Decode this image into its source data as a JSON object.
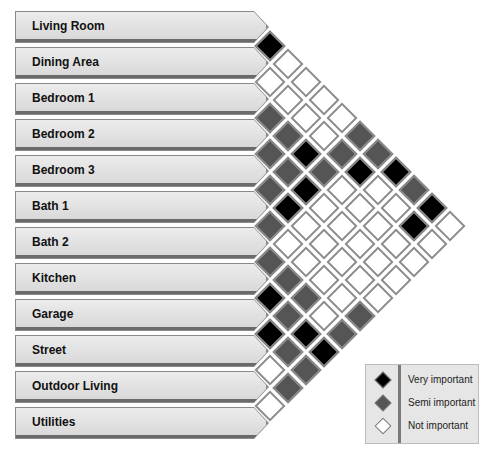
{
  "diagram": {
    "type": "adjacency-matrix",
    "rows": [
      {
        "label": "Living Room"
      },
      {
        "label": "Dining Area"
      },
      {
        "label": "Bedroom 1"
      },
      {
        "label": "Bedroom 2"
      },
      {
        "label": "Bedroom 3"
      },
      {
        "label": "Bath 1"
      },
      {
        "label": "Bath 2"
      },
      {
        "label": "Kitchen"
      },
      {
        "label": "Garage"
      },
      {
        "label": "Street"
      },
      {
        "label": "Outdoor Living"
      },
      {
        "label": "Utilities"
      }
    ],
    "relationships": [
      {
        "a": 0,
        "b": 1,
        "level": "V"
      },
      {
        "a": 0,
        "b": 2,
        "level": "N"
      },
      {
        "a": 0,
        "b": 3,
        "level": "N"
      },
      {
        "a": 0,
        "b": 4,
        "level": "N"
      },
      {
        "a": 0,
        "b": 5,
        "level": "N"
      },
      {
        "a": 0,
        "b": 6,
        "level": "S"
      },
      {
        "a": 0,
        "b": 7,
        "level": "S"
      },
      {
        "a": 0,
        "b": 8,
        "level": "V"
      },
      {
        "a": 0,
        "b": 9,
        "level": "S"
      },
      {
        "a": 0,
        "b": 10,
        "level": "V"
      },
      {
        "a": 0,
        "b": 11,
        "level": "N"
      },
      {
        "a": 1,
        "b": 2,
        "level": "N"
      },
      {
        "a": 1,
        "b": 3,
        "level": "N"
      },
      {
        "a": 1,
        "b": 4,
        "level": "N"
      },
      {
        "a": 1,
        "b": 5,
        "level": "N"
      },
      {
        "a": 1,
        "b": 6,
        "level": "S"
      },
      {
        "a": 1,
        "b": 7,
        "level": "V"
      },
      {
        "a": 1,
        "b": 8,
        "level": "N"
      },
      {
        "a": 1,
        "b": 9,
        "level": "N"
      },
      {
        "a": 1,
        "b": 10,
        "level": "V"
      },
      {
        "a": 1,
        "b": 11,
        "level": "N"
      },
      {
        "a": 2,
        "b": 3,
        "level": "S"
      },
      {
        "a": 2,
        "b": 4,
        "level": "S"
      },
      {
        "a": 2,
        "b": 5,
        "level": "V"
      },
      {
        "a": 2,
        "b": 6,
        "level": "S"
      },
      {
        "a": 2,
        "b": 7,
        "level": "N"
      },
      {
        "a": 2,
        "b": 8,
        "level": "N"
      },
      {
        "a": 2,
        "b": 9,
        "level": "N"
      },
      {
        "a": 2,
        "b": 10,
        "level": "N"
      },
      {
        "a": 2,
        "b": 11,
        "level": "N"
      },
      {
        "a": 3,
        "b": 4,
        "level": "S"
      },
      {
        "a": 3,
        "b": 5,
        "level": "S"
      },
      {
        "a": 3,
        "b": 6,
        "level": "V"
      },
      {
        "a": 3,
        "b": 7,
        "level": "N"
      },
      {
        "a": 3,
        "b": 8,
        "level": "N"
      },
      {
        "a": 3,
        "b": 9,
        "level": "N"
      },
      {
        "a": 3,
        "b": 10,
        "level": "N"
      },
      {
        "a": 3,
        "b": 11,
        "level": "N"
      },
      {
        "a": 4,
        "b": 5,
        "level": "S"
      },
      {
        "a": 4,
        "b": 6,
        "level": "V"
      },
      {
        "a": 4,
        "b": 7,
        "level": "N"
      },
      {
        "a": 4,
        "b": 8,
        "level": "N"
      },
      {
        "a": 4,
        "b": 9,
        "level": "N"
      },
      {
        "a": 4,
        "b": 10,
        "level": "N"
      },
      {
        "a": 4,
        "b": 11,
        "level": "N"
      },
      {
        "a": 5,
        "b": 6,
        "level": "S"
      },
      {
        "a": 5,
        "b": 7,
        "level": "N"
      },
      {
        "a": 5,
        "b": 8,
        "level": "N"
      },
      {
        "a": 5,
        "b": 9,
        "level": "N"
      },
      {
        "a": 5,
        "b": 10,
        "level": "N"
      },
      {
        "a": 5,
        "b": 11,
        "level": "S"
      },
      {
        "a": 6,
        "b": 7,
        "level": "S"
      },
      {
        "a": 6,
        "b": 8,
        "level": "S"
      },
      {
        "a": 6,
        "b": 9,
        "level": "S"
      },
      {
        "a": 6,
        "b": 10,
        "level": "N"
      },
      {
        "a": 6,
        "b": 11,
        "level": "S"
      },
      {
        "a": 7,
        "b": 8,
        "level": "V"
      },
      {
        "a": 7,
        "b": 9,
        "level": "S"
      },
      {
        "a": 7,
        "b": 10,
        "level": "V"
      },
      {
        "a": 7,
        "b": 11,
        "level": "V"
      },
      {
        "a": 8,
        "b": 9,
        "level": "V"
      },
      {
        "a": 8,
        "b": 10,
        "level": "S"
      },
      {
        "a": 8,
        "b": 11,
        "level": "S"
      },
      {
        "a": 9,
        "b": 10,
        "level": "N"
      },
      {
        "a": 9,
        "b": 11,
        "level": "S"
      },
      {
        "a": 10,
        "b": 11,
        "level": "N"
      }
    ]
  },
  "legend": {
    "items": [
      {
        "key": "V",
        "label": "Very important",
        "color": "#000000"
      },
      {
        "key": "S",
        "label": "Semi important",
        "color": "#555555"
      },
      {
        "key": "N",
        "label": "Not important",
        "color": "#ffffff"
      }
    ]
  }
}
